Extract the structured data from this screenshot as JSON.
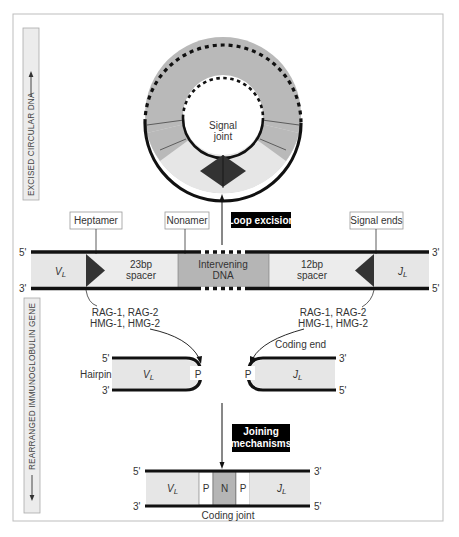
{
  "side_labels": {
    "top": "EXCISED CIRCULAR DNA",
    "bottom": "REARRANGED IMMUNOGLOBULIN GENE"
  },
  "circle": {
    "center_label_line1": "Signal",
    "center_label_line2": "joint"
  },
  "callouts": {
    "heptamer": "Heptamer",
    "nonamer": "Nonamer",
    "loop_excision": "Loop excision",
    "signal_ends": "Signal ends",
    "joining_line1": "Joining",
    "joining_line2": "mechanisms"
  },
  "germline": {
    "left_top_end": "5'",
    "left_bottom_end": "3'",
    "right_top_end": "3'",
    "right_bottom_end": "5'",
    "v_segment": "V",
    "v_sub": "L",
    "spacer23_line1": "23bp",
    "spacer23_line2": "spacer",
    "intervening_line1": "Intervening",
    "intervening_line2": "DNA",
    "spacer12_line1": "12bp",
    "spacer12_line2": "spacer",
    "j_segment": "J",
    "j_sub": "L"
  },
  "enzymes": {
    "left_line1": "RAG-1, RAG-2",
    "left_line2": "HMG-1, HMG-2",
    "right_line1": "RAG-1, RAG-2",
    "right_line2": "HMG-1, HMG-2"
  },
  "hairpins": {
    "hairpin_label": "Hairpin",
    "coding_end_label": "Coding end",
    "left_top_end": "5'",
    "left_bottom_end": "3'",
    "left_segment": "V",
    "left_sub": "L",
    "left_p": "P",
    "right_top_end": "3'",
    "right_bottom_end": "5'",
    "right_segment": "J",
    "right_sub": "L",
    "right_p": "P"
  },
  "coding_joint": {
    "left_top_end": "5'",
    "left_bottom_end": "3'",
    "right_top_end": "3'",
    "right_bottom_end": "5'",
    "v_segment": "V",
    "v_sub": "L",
    "p1": "P",
    "n": "N",
    "p2": "P",
    "j_segment": "J",
    "j_sub": "L",
    "caption": "Coding joint"
  },
  "colors": {
    "frame": "#bdbdbd",
    "light_fill": "#e6e6e6",
    "mid_fill": "#b5b5b5",
    "dark": "#333333",
    "strand": "#111111",
    "label_bg": "#000000"
  }
}
